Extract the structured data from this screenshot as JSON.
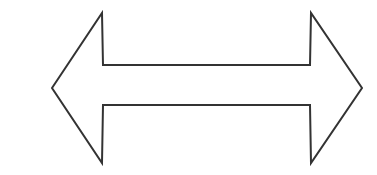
{
  "figure": {
    "name": "double-headed-arrow",
    "background_color": "#ffffff",
    "stroke_color": "#333333",
    "fill_color": "none",
    "stroke_width": 2,
    "canvas": {
      "width": 377,
      "height": 175
    },
    "orientation": "horizontal",
    "head_count": 2,
    "geometry": {
      "left_tip": [
        52,
        88
      ],
      "right_tip": [
        362,
        88
      ],
      "shaft_top_y": 65,
      "shaft_bottom_y": 105,
      "head_top_y": 13,
      "head_bottom_y": 163,
      "left_head_base_x": 102,
      "right_head_base_x": 311,
      "points": "52,88 102,13 103,65 310,65 311,13 362,88 311,163 310,105 103,105 102,163"
    }
  }
}
